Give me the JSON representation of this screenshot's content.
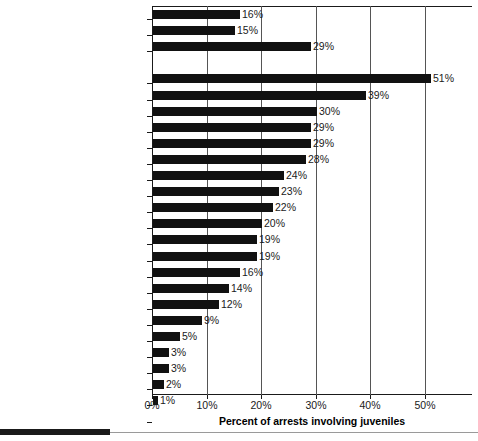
{
  "chart_data": {
    "type": "bar",
    "orientation": "horizontal",
    "title": "",
    "xlabel": "Percent of arrests involving juveniles",
    "ylabel": "",
    "xlim": [
      0,
      57
    ],
    "xticks": [
      0,
      10,
      20,
      30,
      40,
      50
    ],
    "xtick_labels": [
      "0%",
      "10%",
      "20%",
      "30%",
      "40%",
      "50%"
    ],
    "grid": "vertical",
    "legend": "none",
    "value_label_suffix": "%",
    "bar_color": "#111111",
    "categories": [
      "All arrests",
      "Violent Crime Index",
      "Property Crime Index",
      "Arson",
      "Vandalism",
      "Disorderly conduct",
      "Burglary",
      "Motor vehicle theft",
      "Larceny–theft",
      "Robbery",
      "Weapons",
      "Liquor laws",
      "Sex offense",
      "Other assault",
      "Stolen property",
      "Forcible rape",
      "Aggravated assault",
      "Drug abuse",
      "Murder",
      "Offenses against the family",
      "Drunkenness",
      "Fraud",
      "Prostitution",
      "Driving under the influence"
    ],
    "values": [
      16,
      15,
      29,
      51,
      39,
      30,
      29,
      29,
      28,
      24,
      23,
      22,
      20,
      19,
      19,
      16,
      14,
      12,
      9,
      5,
      3,
      3,
      2,
      1
    ],
    "value_labels": [
      "16%",
      "15%",
      "29%",
      "51%",
      "39%",
      "30%",
      "29%",
      "29%",
      "28%",
      "24%",
      "23%",
      "22%",
      "20%",
      "19%",
      "19%",
      "16%",
      "14%",
      "12%",
      "9%",
      "5%",
      "3%",
      "3%",
      "2%",
      "1%"
    ],
    "group_gap_after_index": 2
  }
}
